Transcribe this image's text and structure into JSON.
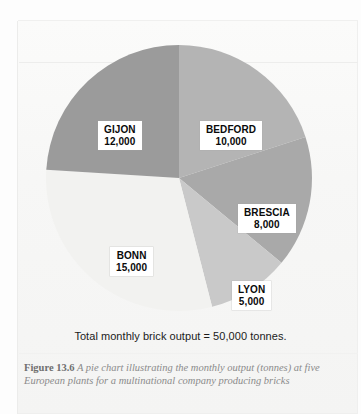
{
  "figure": {
    "caption_number": "Figure 13.6",
    "caption_text": "A pie chart illustrating the monthly output (tonnes) at five European plants for a multinational company producing bricks",
    "total_line": "Total monthly brick output = 50,000 tonnes."
  },
  "chart_data": {
    "type": "pie",
    "title": "",
    "subtitle": "",
    "xlabel": "",
    "ylabel": "",
    "unit": "tonnes",
    "total": 50000,
    "total_label": "Total monthly brick output = 50,000 tonnes.",
    "start_angle_deg": 0,
    "direction": "clockwise",
    "legend": "none (labels drawn on slices)",
    "grid": false,
    "categories": [
      "BEDFORD",
      "BRESCIA",
      "LYON",
      "BONN",
      "GIJON"
    ],
    "values": [
      10000,
      8000,
      5000,
      15000,
      12000
    ],
    "value_labels": [
      "10,000",
      "8,000",
      "5,000",
      "15,000",
      "12,000"
    ],
    "percentages": [
      20,
      16,
      10,
      30,
      24
    ],
    "angles_deg": [
      72,
      57.6,
      36,
      108,
      86.4
    ],
    "colors": [
      "#b4b4b4",
      "#a9a9a9",
      "#c9c9c9",
      "#f2f2f0",
      "#9b9b9b"
    ],
    "slices": [
      {
        "name": "BEDFORD",
        "value": 10000,
        "value_label": "10,000",
        "percent": 20,
        "angle_deg": 72,
        "start_deg": 0,
        "end_deg": 72,
        "color": "#b4b4b4"
      },
      {
        "name": "BRESCIA",
        "value": 8000,
        "value_label": "8,000",
        "percent": 16,
        "angle_deg": 57.6,
        "start_deg": 72,
        "end_deg": 129.6,
        "color": "#a9a9a9"
      },
      {
        "name": "LYON",
        "value": 5000,
        "value_label": "5,000",
        "percent": 10,
        "angle_deg": 36,
        "start_deg": 129.6,
        "end_deg": 165.6,
        "color": "#c9c9c9"
      },
      {
        "name": "BONN",
        "value": 15000,
        "value_label": "15,000",
        "percent": 30,
        "angle_deg": 108,
        "start_deg": 165.6,
        "end_deg": 273.6,
        "color": "#f2f2f0"
      },
      {
        "name": "GIJON",
        "value": 12000,
        "value_label": "12,000",
        "percent": 24,
        "angle_deg": 86.4,
        "start_deg": 273.6,
        "end_deg": 360,
        "color": "#9b9b9b"
      }
    ]
  }
}
